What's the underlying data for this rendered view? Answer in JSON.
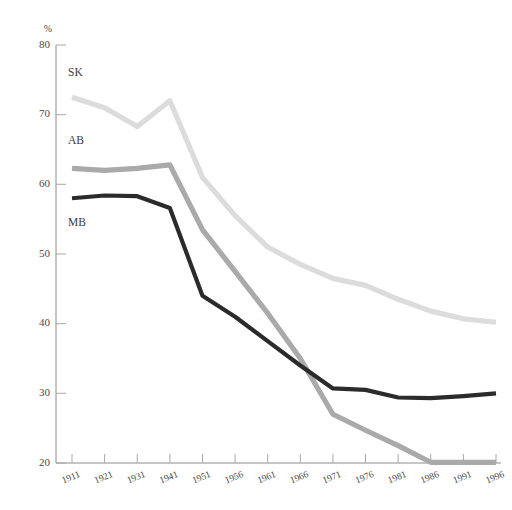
{
  "chart_data": {
    "type": "line",
    "title": "",
    "xlabel": "",
    "ylabel": "%",
    "unit_label": "%",
    "grid": false,
    "legend_position": "inline-left",
    "x": [
      "1911",
      "1921",
      "1931",
      "1941",
      "1951",
      "1956",
      "1961",
      "1966",
      "1971",
      "1976",
      "1981",
      "1986",
      "1991",
      "1996"
    ],
    "categories": [
      "1911",
      "1921",
      "1931",
      "1941",
      "1951",
      "1956",
      "1961",
      "1966",
      "1971",
      "1976",
      "1981",
      "1986",
      "1991",
      "1996"
    ],
    "xlim": [
      1911,
      1996
    ],
    "ylim": [
      20,
      80
    ],
    "yticks": [
      20,
      30,
      40,
      50,
      60,
      70,
      80
    ],
    "ytick_labels": [
      "20",
      "30",
      "40",
      "50",
      "60",
      "70",
      "80"
    ],
    "series": [
      {
        "name": "SK",
        "color": "#dcdcdc",
        "label_x": "1913",
        "label_y": "75.5",
        "values": [
          72.5,
          71.0,
          68.3,
          72.0,
          61.0,
          55.5,
          51.0,
          48.5,
          46.5,
          45.5,
          43.5,
          41.8,
          40.7,
          40.2
        ]
      },
      {
        "name": "AB",
        "color": "#aaaaaa",
        "label_x": "1913",
        "label_y": "65.8",
        "values": [
          62.3,
          62.0,
          62.3,
          62.8,
          53.5,
          47.5,
          41.5,
          35.0,
          27.0,
          24.7,
          22.5,
          20.1,
          20.1,
          20.1
        ]
      },
      {
        "name": "MB",
        "color": "#2b2b2b",
        "label_x": "1913",
        "label_y": "54.0",
        "values": [
          58.0,
          58.4,
          58.3,
          56.6,
          44.0,
          41.0,
          37.5,
          34.0,
          30.7,
          30.5,
          29.4,
          29.3,
          29.6,
          30.0
        ]
      }
    ]
  },
  "axis": {
    "y_unit": "%",
    "y_labels": [
      "80",
      "70",
      "60",
      "50",
      "40",
      "30",
      "20"
    ],
    "x_labels": [
      "1911",
      "1921",
      "1931",
      "1941",
      "1951",
      "1956",
      "1961",
      "1966",
      "1971",
      "1976",
      "1981",
      "1986",
      "1991",
      "1996"
    ]
  },
  "series_labels": {
    "sk": "SK",
    "ab": "AB",
    "mb": "MB"
  },
  "colors": {
    "sk": "#dcdcdc",
    "ab": "#aaaaaa",
    "mb": "#2b2b2b",
    "axis": "#8c8c8c",
    "text": "#4a4a4a",
    "background": "#ffffff"
  }
}
